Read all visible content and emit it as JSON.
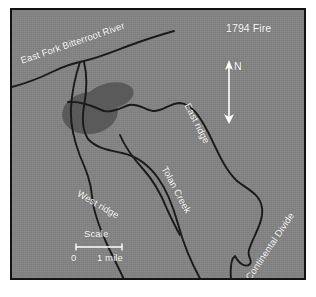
{
  "figure": {
    "kind": "thematic-fire-perimeter-map",
    "title": "1794 Fire"
  },
  "map": {
    "background_color": "#848484",
    "border_color": "#141414",
    "line_color": "#1a1a1a",
    "label_color": "#ffffff",
    "burn_area_color": "#5a5a5a",
    "labels": {
      "river": "East Fork Bitterroot River",
      "east_ridge": "East ridge",
      "tolan_creek": "Tolan Creek",
      "west_ridge": "West ridge",
      "continental_divide": "Continental Divide"
    }
  },
  "north_arrow": {
    "letter": "N"
  },
  "scale_bar": {
    "caption": "Scale",
    "min_label": "0",
    "max_label": "1 mile"
  },
  "features": {
    "river_path": "M -4 78 L 18 72 L 34 66 L 48 59 L 62 54 L 72 51 L 86 48 L 100 43 L 116 37 L 132 31 L 148 26 L 160 22",
    "left_drainage_path": "M 68 52 L 65 60 L 62 72 L 60 86 L 59 100 L 59 112 L 61 124 L 64 136 L 68 147 L 72 156 L 76 166 L 79 176 L 80 186 L 80 196 L 82 206 L 86 216 L 91 226 L 96 236 L 101 246 L 106 256 L 110 266 L 113 272",
    "right_drainage_path": "M 72 52 L 74 62 L 75 74 L 74 86 L 72 98 L 70 108 L 70 118 L 73 126 L 79 132 L 87 136 L 96 139 L 105 141 L 114 144 L 122 148 L 130 154 L 138 160 L 145 167 L 151 175 L 156 184 L 160 194 L 163 204 L 166 214 L 169 224 L 172 234 L 176 244 L 181 254 L 186 264 L 190 272",
    "east_ridge_path": "M 56 92 L 66 92 L 76 94 L 86 98 L 95 101 L 103 100 L 111 96 L 119 94 L 127 96 L 134 100 L 141 101 L 148 98 L 155 94 L 162 92 L 170 93 L 178 98 L 186 106 L 193 116 L 199 126 L 204 136 L 209 146 L 214 156 L 219 164 L 225 170 L 232 174 L 239 177 L 245 182 L 249 190 L 250 199 L 248 208 L 244 216 L 240 224 L 237 232 L 236 240 L 238 246 L 241 250 L 238 254 L 233 256 L 228 254 L 225 250 L 223 246 L 220 248 L 218 254 L 218 262 L 219 270",
    "tolan_creek_path": "M 108 125 L 112 134 L 117 143 L 123 151 L 130 158 L 137 165 L 143 173 L 148 182 L 152 191 L 156 200 L 160 209 L 164 217 L 168 224",
    "burn_area_ellipses": [
      {
        "cx": 98,
        "cy": 86,
        "rx": 24,
        "ry": 13,
        "rotation": -12
      },
      {
        "cx": 78,
        "cy": 103,
        "rx": 28,
        "ry": 21,
        "rotation": -8
      }
    ]
  }
}
